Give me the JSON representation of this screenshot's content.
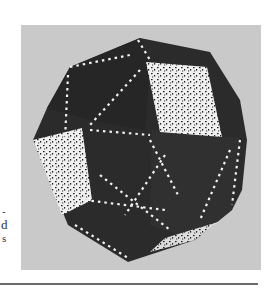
{
  "figure": {
    "panel_background": "#c9c9c9",
    "face_color": "#2b2b2b",
    "edge_mark_color": "#f2f2f2",
    "speckle_face_color": "#f0f0f0"
  },
  "margin_text": {
    "line1": "-",
    "line2": "d",
    "line3": "s"
  },
  "colors": {
    "page_background": "#ffffff",
    "rule": "#6a6a6a"
  }
}
